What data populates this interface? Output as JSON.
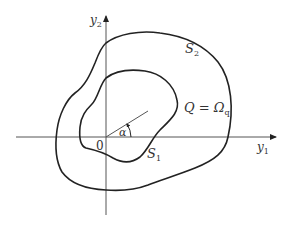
{
  "diagram": {
    "axes": {
      "x_label": "y",
      "x_sub": "1",
      "y_label": "y",
      "y_sub": "2",
      "origin_label": "0"
    },
    "curves": [
      {
        "name": "outer",
        "label": "S",
        "sub": "2",
        "prime": "′"
      },
      {
        "name": "inner",
        "label": "S",
        "sub": "1"
      }
    ],
    "region_label": {
      "text": "Q = Ω",
      "sub": "q"
    },
    "angle_label": "α",
    "colors": {
      "line": "#222222",
      "axis": "#444444",
      "background": "#ffffff"
    }
  }
}
